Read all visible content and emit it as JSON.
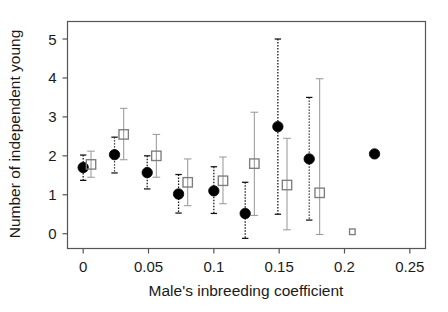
{
  "chart_data": {
    "type": "scatter",
    "title": "",
    "subtitle": "",
    "xlabel": "Male's inbreeding coefficient",
    "ylabel": "Number of independent young",
    "xlim": [
      -0.012,
      0.262
    ],
    "ylim": [
      -0.38,
      5.45
    ],
    "xticks": [
      0,
      0.05,
      0.1,
      0.15,
      0.2,
      0.25
    ],
    "xtick_labels": [
      "0",
      "0.05",
      "0.1",
      "0.15",
      "0.2",
      "0.25"
    ],
    "yticks": [
      0,
      1,
      2,
      3,
      4,
      5
    ],
    "ytick_labels": [
      "0",
      "1",
      "2",
      "3",
      "4",
      "5"
    ],
    "grid": false,
    "legend": "none",
    "error_bars": "vertical, dotted for filled circles, solid grey for open squares",
    "series": [
      {
        "name": "filled-circle",
        "marker": "filled circle",
        "color": "#000000",
        "errorbar_style": "dotted",
        "points": [
          {
            "x": 0.0,
            "y": 1.7,
            "ylow": 1.37,
            "yhigh": 2.02
          },
          {
            "x": 0.024,
            "y": 2.03,
            "ylow": 1.56,
            "yhigh": 2.48
          },
          {
            "x": 0.049,
            "y": 1.57,
            "ylow": 1.15,
            "yhigh": 2.0
          },
          {
            "x": 0.073,
            "y": 1.02,
            "ylow": 0.53,
            "yhigh": 1.52
          },
          {
            "x": 0.1,
            "y": 1.1,
            "ylow": 0.52,
            "yhigh": 1.72
          },
          {
            "x": 0.124,
            "y": 0.52,
            "ylow": -0.12,
            "yhigh": 1.32
          },
          {
            "x": 0.149,
            "y": 2.75,
            "ylow": 0.5,
            "yhigh": 5.0
          },
          {
            "x": 0.173,
            "y": 1.92,
            "ylow": 0.35,
            "yhigh": 3.5
          },
          {
            "x": 0.223,
            "y": 2.05,
            "ylow": null,
            "yhigh": null
          }
        ]
      },
      {
        "name": "open-square",
        "marker": "open square",
        "color": "#8c8c8c",
        "errorbar_style": "solid",
        "points": [
          {
            "x": 0.006,
            "y": 1.78,
            "ylow": 1.45,
            "yhigh": 2.12
          },
          {
            "x": 0.031,
            "y": 2.55,
            "ylow": 1.9,
            "yhigh": 3.22
          },
          {
            "x": 0.056,
            "y": 2.0,
            "ylow": 1.45,
            "yhigh": 2.55
          },
          {
            "x": 0.08,
            "y": 1.32,
            "ylow": 0.72,
            "yhigh": 1.92
          },
          {
            "x": 0.107,
            "y": 1.36,
            "ylow": 0.77,
            "yhigh": 1.97
          },
          {
            "x": 0.131,
            "y": 1.8,
            "ylow": 0.47,
            "yhigh": 3.12
          },
          {
            "x": 0.156,
            "y": 1.25,
            "ylow": 0.1,
            "yhigh": 2.45
          },
          {
            "x": 0.181,
            "y": 1.05,
            "ylow": -0.02,
            "yhigh": 3.98
          },
          {
            "x": 0.206,
            "y": 0.05,
            "ylow": null,
            "yhigh": null
          }
        ]
      }
    ]
  }
}
